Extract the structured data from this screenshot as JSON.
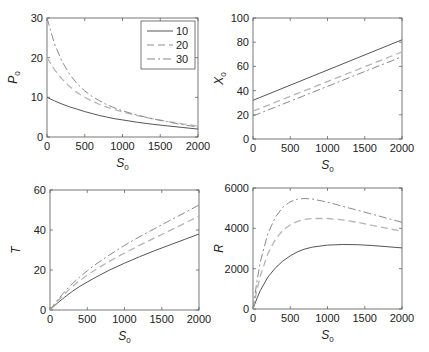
{
  "figure": {
    "width": 429,
    "height": 352,
    "legend_title": ""
  },
  "styles": {
    "10": {
      "color": "#555555",
      "dash": "",
      "width": 1
    },
    "20": {
      "color": "#b5b5b5",
      "dash": "7,4",
      "width": 1.3
    },
    "30": {
      "color": "#8a8a8a",
      "dash": "8,3,2,3",
      "width": 1
    }
  },
  "chart_data": [
    {
      "id": "P0",
      "type": "line",
      "title": "",
      "xlabel": "S",
      "xlabel_sub": "0",
      "ylabel": "P",
      "ylabel_sub": "0",
      "xlim": [
        0,
        2000
      ],
      "ylim": [
        0,
        30
      ],
      "xticks": [
        0,
        500,
        1000,
        1500,
        2000
      ],
      "yticks": [
        0,
        10,
        20,
        30
      ],
      "grid": false,
      "legend": {
        "position": "upper right",
        "entries": [
          "10",
          "20",
          "30"
        ]
      },
      "box": {
        "left": 47,
        "top": 18,
        "right": 198,
        "bottom": 137
      },
      "x": [
        0,
        100,
        200,
        300,
        400,
        500,
        600,
        700,
        800,
        900,
        1000,
        1200,
        1400,
        1600,
        1800,
        2000
      ],
      "series": [
        {
          "name": "10",
          "values": [
            10,
            9.1,
            8.3,
            7.6,
            7.0,
            6.4,
            5.9,
            5.4,
            5.0,
            4.6,
            4.3,
            3.7,
            3.2,
            2.8,
            2.4,
            2.0
          ]
        },
        {
          "name": "20",
          "values": [
            20,
            17.0,
            14.6,
            12.7,
            11.2,
            10.0,
            9.0,
            8.2,
            7.5,
            6.9,
            6.3,
            5.4,
            4.6,
            3.9,
            3.3,
            2.8
          ]
        },
        {
          "name": "30",
          "values": [
            30,
            23.5,
            19.0,
            15.8,
            13.4,
            11.6,
            10.2,
            9.1,
            8.1,
            7.3,
            6.6,
            5.5,
            4.6,
            3.8,
            3.1,
            2.5
          ]
        }
      ]
    },
    {
      "id": "X0",
      "type": "line",
      "title": "",
      "xlabel": "S",
      "xlabel_sub": "0",
      "ylabel": "X",
      "ylabel_sub": "0",
      "xlim": [
        0,
        2000
      ],
      "ylim": [
        0,
        100
      ],
      "xticks": [
        0,
        500,
        1000,
        1500,
        2000
      ],
      "yticks": [
        0,
        20,
        40,
        60,
        80,
        100
      ],
      "grid": false,
      "legend": null,
      "box": {
        "left": 253,
        "top": 18,
        "right": 402,
        "bottom": 139
      },
      "x": [
        0,
        2000
      ],
      "series": [
        {
          "name": "10",
          "values": [
            32,
            82
          ]
        },
        {
          "name": "20",
          "values": [
            23,
            72
          ]
        },
        {
          "name": "30",
          "values": [
            19,
            68
          ]
        }
      ]
    },
    {
      "id": "T",
      "type": "line",
      "title": "",
      "xlabel": "S",
      "xlabel_sub": "0",
      "ylabel": "T",
      "ylabel_sub": "",
      "xlim": [
        0,
        2000
      ],
      "ylim": [
        0,
        60
      ],
      "xticks": [
        0,
        500,
        1000,
        1500,
        2000
      ],
      "yticks": [
        0,
        20,
        40,
        60
      ],
      "grid": false,
      "legend": null,
      "box": {
        "left": 50,
        "top": 190,
        "right": 199,
        "bottom": 310
      },
      "x": [
        0,
        100,
        200,
        300,
        400,
        500,
        600,
        800,
        1000,
        1200,
        1400,
        1600,
        1800,
        2000
      ],
      "series": [
        {
          "name": "10",
          "values": [
            0,
            3.5,
            6.5,
            9.3,
            11.8,
            14.0,
            16.1,
            20.0,
            23.4,
            26.6,
            29.6,
            32.4,
            35.2,
            38.0
          ]
        },
        {
          "name": "20",
          "values": [
            0,
            4.5,
            8.3,
            11.7,
            14.7,
            17.4,
            19.9,
            24.4,
            28.5,
            32.3,
            35.9,
            39.6,
            43.2,
            47.0
          ]
        },
        {
          "name": "30",
          "values": [
            0,
            5.0,
            9.3,
            13.1,
            16.5,
            19.6,
            22.5,
            27.6,
            32.3,
            36.6,
            40.6,
            44.6,
            48.5,
            52.5
          ]
        }
      ]
    },
    {
      "id": "R",
      "type": "line",
      "title": "",
      "xlabel": "S",
      "xlabel_sub": "0",
      "ylabel": "R",
      "ylabel_sub": "",
      "xlim": [
        0,
        2000
      ],
      "ylim": [
        0,
        6000
      ],
      "xticks": [
        0,
        500,
        1000,
        1500,
        2000
      ],
      "yticks": [
        0,
        2000,
        4000,
        6000
      ],
      "grid": false,
      "legend": null,
      "box": {
        "left": 253,
        "top": 188,
        "right": 402,
        "bottom": 309
      },
      "x": [
        0,
        50,
        100,
        200,
        300,
        400,
        500,
        600,
        700,
        800,
        1000,
        1200,
        1400,
        1600,
        1800,
        2000
      ],
      "series": [
        {
          "name": "10",
          "values": [
            0,
            500,
            920,
            1580,
            2040,
            2380,
            2640,
            2840,
            2980,
            3070,
            3170,
            3200,
            3190,
            3150,
            3090,
            3030
          ]
        },
        {
          "name": "20",
          "values": [
            0,
            900,
            1650,
            2750,
            3450,
            3900,
            4180,
            4350,
            4450,
            4490,
            4490,
            4420,
            4300,
            4150,
            4000,
            3850
          ]
        },
        {
          "name": "30",
          "values": [
            0,
            1300,
            2350,
            3750,
            4550,
            5050,
            5320,
            5450,
            5480,
            5450,
            5300,
            5100,
            4900,
            4700,
            4500,
            4300
          ]
        }
      ]
    }
  ]
}
